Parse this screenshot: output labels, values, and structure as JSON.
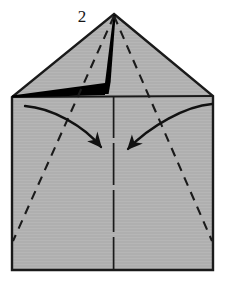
{
  "figure": {
    "kind": "origami-diagram",
    "step_number": "2",
    "title_text": "2",
    "canvas": {
      "width": 227,
      "height": 285
    },
    "colors": {
      "background": "#ffffff",
      "paper_fill": "#aeaeae",
      "paper_fill_light": "#b6b6b6",
      "outline": "#1a1a1a",
      "crease_dashed": "#1a1a1a",
      "black_flap": "#000000",
      "arrow": "#111111",
      "number": "#161616"
    },
    "shape": {
      "name": "pentagon-house-paper",
      "description": "Square sheet with top corners folded to the center forming a house / pentagon silhouette",
      "apex": {
        "x": 114,
        "y": 14
      },
      "left_shoulder": {
        "x": 12,
        "y": 97
      },
      "right_shoulder": {
        "x": 213,
        "y": 96
      },
      "bottom_left": {
        "x": 12,
        "y": 270
      },
      "bottom_right": {
        "x": 213,
        "y": 270
      }
    },
    "creases": [
      {
        "name": "center-vertical-crease",
        "style": "dashed",
        "from": {
          "x": 114,
          "y": 14
        },
        "to": {
          "x": 114,
          "y": 270
        }
      },
      {
        "name": "left-diagonal-crease",
        "style": "dashed",
        "from": {
          "x": 114,
          "y": 16
        },
        "to": {
          "x": 13,
          "y": 241
        }
      },
      {
        "name": "right-diagonal-crease",
        "style": "dashed",
        "from": {
          "x": 114,
          "y": 16
        },
        "to": {
          "x": 212,
          "y": 241
        }
      },
      {
        "name": "shoulder-horizontal-edge",
        "style": "solid",
        "from": {
          "x": 12,
          "y": 97
        },
        "to": {
          "x": 213,
          "y": 96
        }
      }
    ],
    "black_flap": {
      "name": "raised-black-flap",
      "description": "Thin solid black wedge along the left shoulder edge with a vertical black spine rising to the apex"
    },
    "arrows": [
      {
        "name": "fold-arrow-left",
        "direction": "right-down",
        "start": {
          "x": 25,
          "y": 106
        },
        "end": {
          "x": 104,
          "y": 150
        }
      },
      {
        "name": "fold-arrow-right",
        "direction": "left-down",
        "start": {
          "x": 212,
          "y": 104
        },
        "end": {
          "x": 124,
          "y": 152
        }
      }
    ]
  }
}
